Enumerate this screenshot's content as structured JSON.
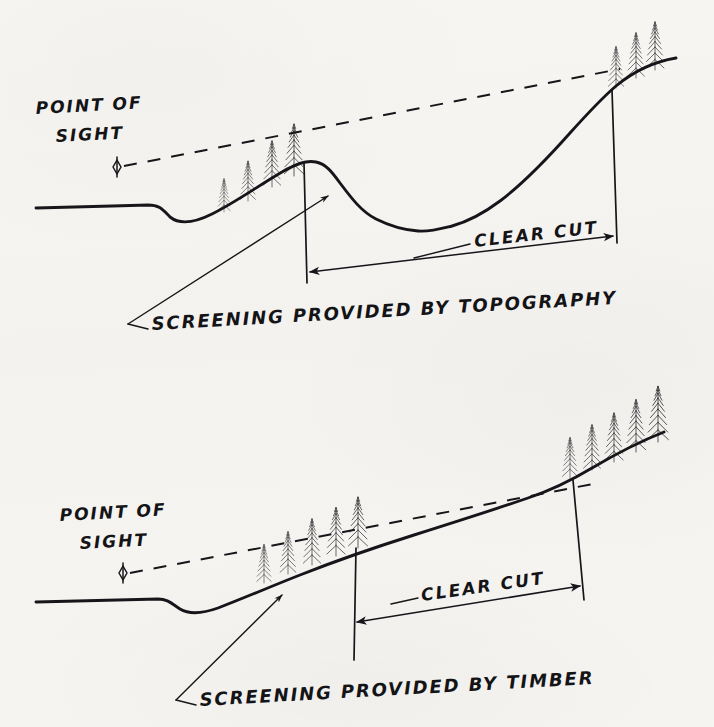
{
  "figure": {
    "medium": "hand-drawn ink line diagram on scanned paper",
    "paper_color": "#f5f4f1",
    "ink_color": "#16161a",
    "panel_count": 2
  },
  "panels": [
    {
      "id": "upper",
      "caption": "SCREENING PROVIDED BY TOPOGRAPHY",
      "point_of_sight": {
        "line1": "POINT OF",
        "line2": "SIGHT",
        "eye_marker": "eye-diamond-icon"
      },
      "clear_cut_label": "CLEAR CUT",
      "tree_groups": [
        {
          "name": "midslope-grove",
          "count": 4
        },
        {
          "name": "ridgetop-grove",
          "count": 3
        }
      ],
      "sight_line_style": "dashed"
    },
    {
      "id": "lower",
      "caption": "SCREENING PROVIDED BY TIMBER",
      "point_of_sight": {
        "line1": "POINT OF",
        "line2": "SIGHT",
        "eye_marker": "eye-diamond-icon"
      },
      "clear_cut_label": "CLEAR CUT",
      "tree_groups": [
        {
          "name": "lower-slope-grove",
          "count": 5
        },
        {
          "name": "upper-slope-grove",
          "count": 5
        }
      ],
      "sight_line_style": "dashed"
    }
  ]
}
